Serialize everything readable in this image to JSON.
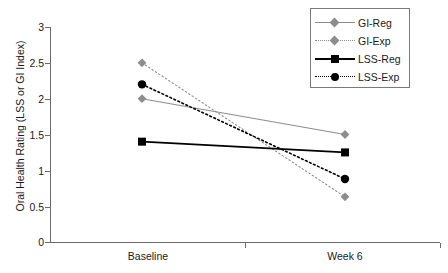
{
  "chart_data": {
    "type": "line",
    "title": "",
    "xlabel": "",
    "ylabel": "Oral Health Rating (LSS or GI Index)",
    "categories": [
      "Baseline",
      "Week 6"
    ],
    "ylim": [
      0,
      3
    ],
    "ytick_labels": [
      "3",
      "2.5",
      "2",
      "1.5",
      "1",
      "0.5",
      "0"
    ],
    "ytick_values": [
      3,
      2.5,
      2,
      1.5,
      1,
      0.5,
      0
    ],
    "grid": false,
    "legend_position": "top-right",
    "series": [
      {
        "name": "GI-Reg",
        "values": [
          2.0,
          1.5
        ],
        "color": "#8d8d8d",
        "line_style": "solid",
        "marker": "diamond"
      },
      {
        "name": "GI-Exp",
        "values": [
          2.5,
          0.63
        ],
        "color": "#8d8d8d",
        "line_style": "dotted",
        "marker": "diamond"
      },
      {
        "name": "LSS-Reg",
        "values": [
          1.4,
          1.25
        ],
        "color": "#000000",
        "line_style": "solid",
        "marker": "square"
      },
      {
        "name": "LSS-Exp",
        "values": [
          2.2,
          0.88
        ],
        "color": "#000000",
        "line_style": "dotted",
        "marker": "circle"
      }
    ]
  },
  "axis": {
    "y_title": "Oral Health Rating (LSS or GI Index)",
    "y_ticks": [
      "3",
      "2.5",
      "2",
      "1.5",
      "1",
      "0.5",
      "0"
    ],
    "x_ticks": [
      "Baseline",
      "Week 6"
    ]
  },
  "legend": {
    "entries": [
      {
        "label": "GI-Reg"
      },
      {
        "label": "GI-Exp"
      },
      {
        "label": "LSS-Reg"
      },
      {
        "label": "LSS-Exp"
      }
    ]
  },
  "colors": {
    "gi_series": "#8d8d8d",
    "lss_series": "#000000",
    "axis": "#6b6b6b",
    "background": "#ffffff"
  }
}
